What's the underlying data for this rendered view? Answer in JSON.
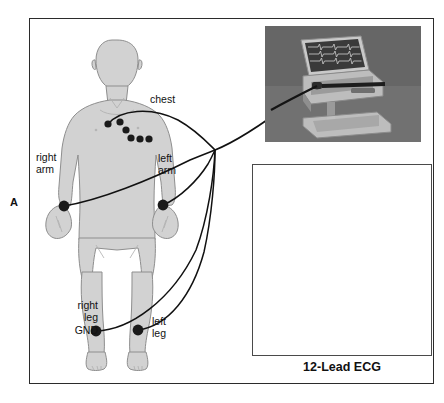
{
  "figure": {
    "panel_letter": "A",
    "caption": "12-Lead ECG"
  },
  "body_diagram": {
    "labels": {
      "chest": "chest",
      "right_arm": "right\narm",
      "left_arm": "left\narm",
      "right_leg": "right\nleg",
      "ground": "GND",
      "left_leg": "left\nleg"
    },
    "electrodes": [
      {
        "name": "chest-v1",
        "x": 108,
        "y": 124,
        "r": 3.6
      },
      {
        "name": "chest-v2",
        "x": 120,
        "y": 122,
        "r": 3.6
      },
      {
        "name": "chest-v3",
        "x": 126,
        "y": 130,
        "r": 3.6
      },
      {
        "name": "chest-v4",
        "x": 131,
        "y": 138,
        "r": 3.6
      },
      {
        "name": "chest-v5",
        "x": 140,
        "y": 139,
        "r": 3.6
      },
      {
        "name": "chest-v6",
        "x": 149,
        "y": 139,
        "r": 3.6
      },
      {
        "name": "right-arm",
        "x": 64,
        "y": 206,
        "r": 5.4
      },
      {
        "name": "left-arm",
        "x": 163,
        "y": 205,
        "r": 5.4
      },
      {
        "name": "right-leg-gnd",
        "x": 96,
        "y": 331,
        "r": 5.4
      },
      {
        "name": "left-leg",
        "x": 138,
        "y": 330,
        "r": 5.4
      }
    ],
    "junction": {
      "x": 215,
      "y": 150
    },
    "colors": {
      "skin_fill": "#d2d2d2",
      "outline": "#8a8a8a",
      "electrode": "#1a1a1a",
      "lead_wire": "#111111",
      "frame": "#2b2b2b"
    }
  },
  "machine_photo": {
    "alt_name": "portable-ecg-machine-on-cart",
    "background": "#6e6e6e"
  },
  "ecg_printout": {
    "alt_name": "twelve-lead-ecg-strip",
    "grid_color": "#e8b6b6",
    "trace_color": "#1a1a1a",
    "header_fields": [
      "UNKNOWN NAME",
      "AGE 72",
      "SEX M",
      "ID 0000"
    ],
    "lead_rows": 4,
    "lead_columns": 3,
    "signature": "Robert J. Harvey MD"
  }
}
